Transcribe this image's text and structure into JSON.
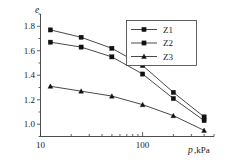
{
  "chart_data": {
    "type": "line",
    "title": "",
    "subtitle": "",
    "xlabel": "p,kPa",
    "ylabel": "e",
    "xscale": "log",
    "yscale": "linear",
    "xlim": [
      10,
      500
    ],
    "ylim": [
      0.9,
      1.9
    ],
    "grid": false,
    "legend_position": "top-right",
    "x": [
      12.5,
      25,
      50,
      100,
      200,
      400
    ],
    "xticks": [
      10,
      100
    ],
    "xtick_labels": [
      "10",
      "100"
    ],
    "yticks": [
      1.0,
      1.2,
      1.4,
      1.6,
      1.8
    ],
    "ytick_labels": [
      "1.0",
      "1.2",
      "1.4",
      "1.6",
      "1.8"
    ],
    "ytick_minor": [
      0.9,
      1.1,
      1.3,
      1.5,
      1.7,
      1.9
    ],
    "series": [
      {
        "name": "Z1",
        "marker": "square",
        "values": [
          1.77,
          1.71,
          1.62,
          1.48,
          1.26,
          1.06
        ]
      },
      {
        "name": "Z2",
        "marker": "square",
        "values": [
          1.67,
          1.63,
          1.55,
          1.41,
          1.21,
          1.03
        ]
      },
      {
        "name": "Z3",
        "marker": "triangle",
        "values": [
          1.31,
          1.27,
          1.23,
          1.16,
          1.07,
          0.95
        ]
      }
    ],
    "annotations": []
  },
  "legend": {
    "entries": [
      {
        "label": "Z1"
      },
      {
        "label": "Z2"
      },
      {
        "label": "Z3"
      }
    ]
  },
  "axes": {
    "y_axis_title": "e",
    "x_axis_title": "p,kPa"
  },
  "colors": {
    "line": "#1a1a1a",
    "marker": "#111111",
    "axis": "#3a3a3a",
    "background": "#ffffff",
    "text": "#1a1a1a"
  }
}
